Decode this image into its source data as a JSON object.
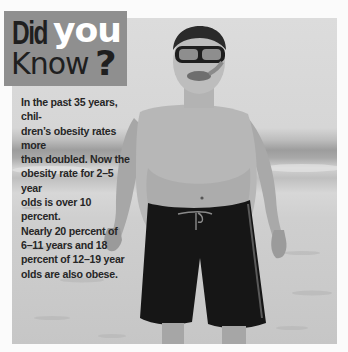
{
  "callout": {
    "title": {
      "word1": "Did",
      "word2": "you",
      "word3": "Know",
      "punct": "?"
    },
    "body": "In the past 35 years, chil-dren's obesity rates more than doubled. Now the obesity rate for 2–5 year olds is over 10 percent. Nearly 20 percent of 6–11 years and 18 percent of 12–19 year olds are also obese.",
    "body_lines": [
      "In the past 35 years, chil-",
      "dren’s obesity rates more",
      "than doubled. Now the",
      "obesity rate for 2–5 year",
      "olds is over 10 percent.",
      "Nearly 20 percent of",
      "6–11 years and 18",
      "percent of 12–19 year",
      "olds are also obese."
    ]
  },
  "photo": {
    "subject": "boy wearing snorkel mask and dark swim shorts standing on a beach",
    "style": "grayscale"
  },
  "colors": {
    "title_box": "#8f8f8f",
    "title_dark": "#1f1f1f",
    "title_light": "#ffffff",
    "body_text": "#262626",
    "page_bg": "#fbfbfb"
  }
}
